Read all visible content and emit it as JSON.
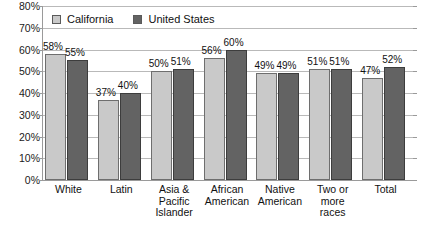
{
  "chart_data": {
    "type": "bar",
    "title": "",
    "subtitle": "",
    "xlabel": "",
    "ylabel": "",
    "ylim": [
      0,
      80
    ],
    "yunit": "%",
    "grid": true,
    "legend_position": "top-left-inside",
    "categories": [
      "White",
      "Latin",
      "Asia & Pacific Islander",
      "African American",
      "Native American",
      "Two or more races",
      "Total"
    ],
    "category_lines": [
      [
        "White"
      ],
      [
        "Latin"
      ],
      [
        "Asia &",
        "Pacific",
        "Islander"
      ],
      [
        "African",
        "American"
      ],
      [
        "Native",
        "American"
      ],
      [
        "Two or",
        "more",
        "races"
      ],
      [
        "Total"
      ]
    ],
    "series": [
      {
        "name": "California",
        "color": "#c9c9c9",
        "values": [
          58,
          37,
          50,
          56,
          49,
          51,
          47
        ],
        "labels": [
          "58%",
          "37%",
          "50%",
          "56%",
          "49%",
          "51%",
          "47%"
        ]
      },
      {
        "name": "United States",
        "color": "#636363",
        "values": [
          55,
          40,
          51,
          60,
          49,
          51,
          52
        ],
        "labels": [
          "55%",
          "40%",
          "51%",
          "60%",
          "49%",
          "51%",
          "52%"
        ]
      }
    ],
    "y_ticks": [
      0,
      10,
      20,
      30,
      40,
      50,
      60,
      70,
      80
    ],
    "y_tick_labels": [
      "0%",
      "10%",
      "20%",
      "30%",
      "40%",
      "50%",
      "60%",
      "70%",
      "80%"
    ]
  },
  "legend": {
    "items": [
      {
        "label": "California",
        "color": "#c9c9c9"
      },
      {
        "label": "United States",
        "color": "#636363"
      }
    ]
  },
  "colors": {
    "series_california": "#c9c9c9",
    "series_united_states": "#636363",
    "gridline": "#b9b9b9",
    "axis": "#9a9a9a",
    "text": "#111111",
    "background": "#ffffff"
  }
}
